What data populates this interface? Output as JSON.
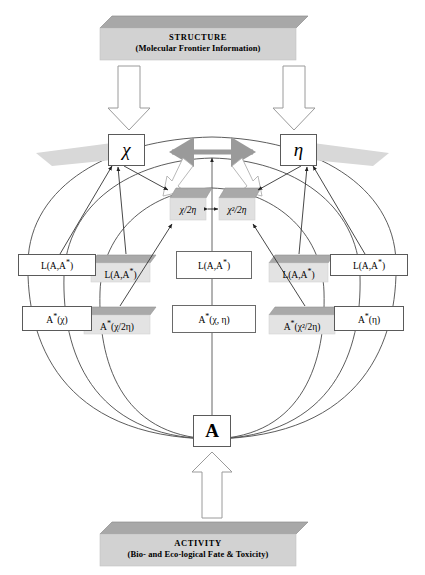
{
  "diagram": {
    "title_top": "STRUCTURE",
    "subtitle_top": "(Molecular Frontier Information)",
    "title_bottom": "ACTIVITY",
    "subtitle_bottom": "(Bio- and Eco-logical Fate & Toxicity)",
    "colors": {
      "banner_fill": "#d2d2d2",
      "banner_top_face": "#a8a8a8",
      "plate_fill": "#e0e0e0",
      "plate_top_face": "#a9a9a9",
      "arrow_gray": "#9a9a9a",
      "line": "#444444",
      "box_border": "#5a5a5a",
      "background": "#ffffff"
    }
  },
  "nodes": {
    "chi": "χ",
    "eta": "η",
    "activity": "A",
    "chi_over_2eta": "χ/2η",
    "chi2_over_2eta": "χ²/2η"
  },
  "descriptors": {
    "l_outer_left": "L(A,A*)",
    "l_inner_left": "L(A,A*)",
    "l_center": "L(A,A*)",
    "l_inner_right": "L(A,A*)",
    "l_outer_right": "L(A,A*)",
    "a_outer_left": "A*(χ)",
    "a_inner_left": "A*(χ/2η)",
    "a_center": "A*(χ, η)",
    "a_inner_right": "A*(χ²/2η)",
    "a_outer_right": "A*(η)"
  },
  "icons": {
    "down_arrow_left": "block-arrow-down-icon",
    "down_arrow_right": "block-arrow-down-icon",
    "up_arrow": "block-arrow-up-icon",
    "chi_eta_arrow": "double-headed-arrow-icon",
    "mid_arrow": "double-headed-arrow-icon",
    "white_arrow_left": "block-arrow-diagonal-icon",
    "white_arrow_right": "block-arrow-diagonal-icon"
  }
}
